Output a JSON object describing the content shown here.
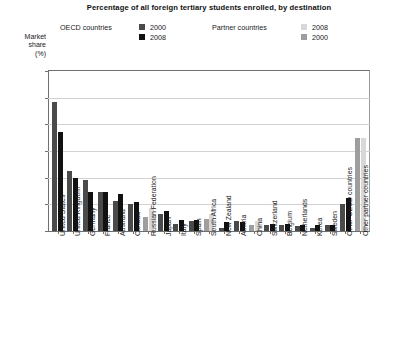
{
  "title": "Percentage of all foreign tertiary students enrolled, by destination",
  "axis": {
    "ylabel_lines": [
      "Market",
      "share",
      "(%)"
    ],
    "yticks": [
      0,
      5,
      10,
      15,
      20,
      25,
      30
    ],
    "ylim": [
      0,
      30
    ],
    "grid": true
  },
  "legend": {
    "position": "top",
    "groups": [
      {
        "title": "OECD countries",
        "entries": [
          {
            "label": "2000",
            "color": "#4a4a4a"
          },
          {
            "label": "2008",
            "color": "#111111"
          }
        ]
      },
      {
        "title": "Partner countries",
        "entries": [
          {
            "label": "2008",
            "color": "#d8d8d8"
          },
          {
            "label": "2000",
            "color": "#9e9e9e"
          }
        ]
      }
    ]
  },
  "chart_data": {
    "type": "bar",
    "title": "Percentage of all foreign tertiary students enrolled, by destination",
    "xlabel": "",
    "ylabel": "Market share (%)",
    "ylim": [
      0,
      30
    ],
    "yticks": [
      0,
      5,
      10,
      15,
      20,
      25,
      30
    ],
    "grid": true,
    "legend_position": "top",
    "categories": [
      "United States",
      "United Kingdom",
      "Germany",
      "France",
      "Australia",
      "Canada",
      "Russian Federation",
      "Japan",
      "Italy",
      "Spain",
      "South Africa",
      "New Zealand",
      "Austria",
      "China",
      "Switzerland",
      "Belgium",
      "Netherlands",
      "Korea",
      "Sweden",
      "Other OECD countries",
      "Other partner countries"
    ],
    "group_types": [
      "oecd",
      "oecd",
      "oecd",
      "oecd",
      "oecd",
      "oecd",
      "partner",
      "oecd",
      "oecd",
      "oecd",
      "partner",
      "oecd",
      "oecd",
      "partner",
      "oecd",
      "oecd",
      "oecd",
      "oecd",
      "oecd",
      "oecd",
      "partner"
    ],
    "series": [
      {
        "name": "2000",
        "values": [
          24.2,
          11.2,
          9.5,
          7.3,
          5.6,
          5.1,
          2.6,
          3.2,
          1.3,
          1.9,
          2.3,
          0.6,
          1.9,
          1.1,
          1.1,
          1.2,
          1.0,
          0.5,
          1.2,
          5.0,
          17.5
        ]
      },
      {
        "name": "2008",
        "values": [
          18.5,
          10.0,
          7.3,
          7.3,
          6.9,
          5.5,
          4.3,
          3.8,
          2.0,
          2.0,
          3.1,
          1.6,
          1.6,
          1.8,
          1.3,
          1.3,
          1.2,
          1.2,
          1.2,
          6.2,
          17.5
        ]
      }
    ],
    "colors": {
      "oecd_2000": "#4a4a4a",
      "oecd_2008": "#111111",
      "partner_2000": "#9e9e9e",
      "partner_2008": "#d8d8d8"
    }
  }
}
